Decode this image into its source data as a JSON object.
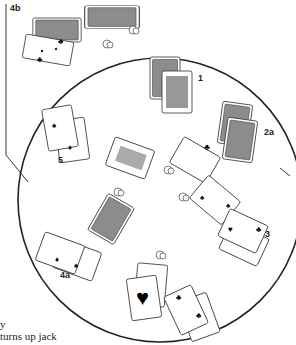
{
  "labels": {
    "area_4b": "4b",
    "player_1": "1",
    "area_2a": "2a",
    "player_5": "5",
    "player_3": "3",
    "area_4a": "4a"
  },
  "caption": {
    "line1": "y",
    "line2": "turns up jack"
  },
  "colors": {
    "ink": "#222222",
    "card_back": "#8c8c8c",
    "card_face": "#ffffff"
  }
}
